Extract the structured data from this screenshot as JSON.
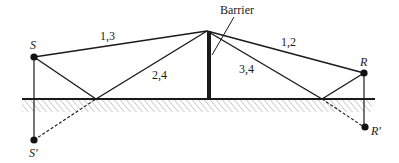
{
  "diagram": {
    "labels": {
      "source": "S",
      "source_image": "S'",
      "receiver": "R",
      "receiver_image": "R'",
      "barrier": "Barrier",
      "path_13": "1,3",
      "path_24": "2,4",
      "path_34": "3,4",
      "path_12": "1,2"
    },
    "colors": {
      "line": "#1a1a1a",
      "hatch": "#7a7a7a",
      "background": "#ffffff"
    }
  }
}
